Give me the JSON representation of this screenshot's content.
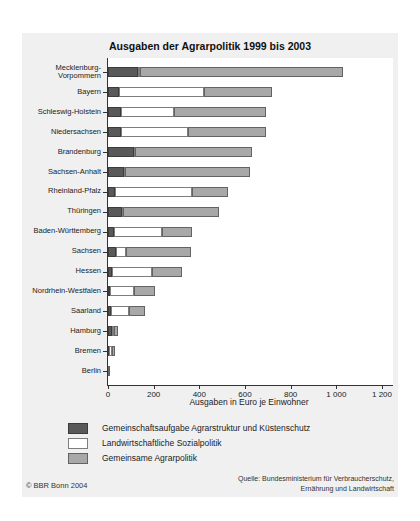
{
  "title": "Ausgaben der Agrarpolitik 1999 bis 2003",
  "footer": {
    "copyright": "© BBR Bonn 2004",
    "source_line1": "Quelle: Bundesministerium für Verbraucherschutz,",
    "source_line2": "Ernährung und Landwirtschaft"
  },
  "colors": {
    "panel_bg": "#f0f0f0",
    "plot_bg": "#ffffff",
    "axis": "#333333",
    "dark": "#595959",
    "dark_border": "#3c3c3c",
    "white": "#ffffff",
    "white_border": "#7d7d7d",
    "gray": "#a8a8a8",
    "gray_border": "#636363"
  },
  "chart_data": {
    "type": "bar",
    "orientation": "horizontal",
    "stacked": true,
    "title": "Ausgaben der Agrarpolitik 1999 bis 2003",
    "xlabel": "Ausgaben in Euro je Einwohner",
    "xlim": [
      0,
      1200
    ],
    "grid": false,
    "legend_position": "bottom-left",
    "x_ticks": [
      {
        "value": 0,
        "label": "0"
      },
      {
        "value": 200,
        "label": "200"
      },
      {
        "value": 400,
        "label": "400"
      },
      {
        "value": 600,
        "label": "600"
      },
      {
        "value": 800,
        "label": "800"
      },
      {
        "value": 1000,
        "label": "1 000"
      },
      {
        "value": 1200,
        "label": "1 200"
      }
    ],
    "categories": [
      "Mecklenburg-Vorpommern",
      "Bayern",
      "Schleswig-Holstein",
      "Niedersachsen",
      "Brandenburg",
      "Sachsen-Anhalt",
      "Rheinland-Pfalz",
      "Thüringen",
      "Baden-Württemberg",
      "Sachsen",
      "Hessen",
      "Nordrhein-Westfalen",
      "Saarland",
      "Hamburg",
      "Bremen",
      "Berlin"
    ],
    "series": [
      {
        "name": "Gemeinschaftsaufgabe Agrarstruktur und Küstenschutz",
        "color_key": "dark",
        "values": [
          130,
          50,
          55,
          55,
          115,
          70,
          30,
          60,
          25,
          35,
          18,
          8,
          13,
          18,
          3,
          1
        ]
      },
      {
        "name": "Landwirtschaftliche Sozialpolitik",
        "color_key": "white",
        "values": [
          10,
          370,
          235,
          295,
          5,
          5,
          340,
          5,
          210,
          45,
          175,
          105,
          77,
          10,
          15,
          1
        ]
      },
      {
        "name": "Gemeinsame Agrarpolitik",
        "color_key": "gray",
        "values": [
          890,
          300,
          400,
          340,
          510,
          545,
          155,
          420,
          135,
          285,
          132,
          92,
          70,
          17,
          12,
          2
        ]
      }
    ],
    "totals": [
      1030,
      720,
      690,
      690,
      630,
      620,
      525,
      485,
      370,
      365,
      325,
      205,
      160,
      45,
      30,
      4
    ]
  }
}
